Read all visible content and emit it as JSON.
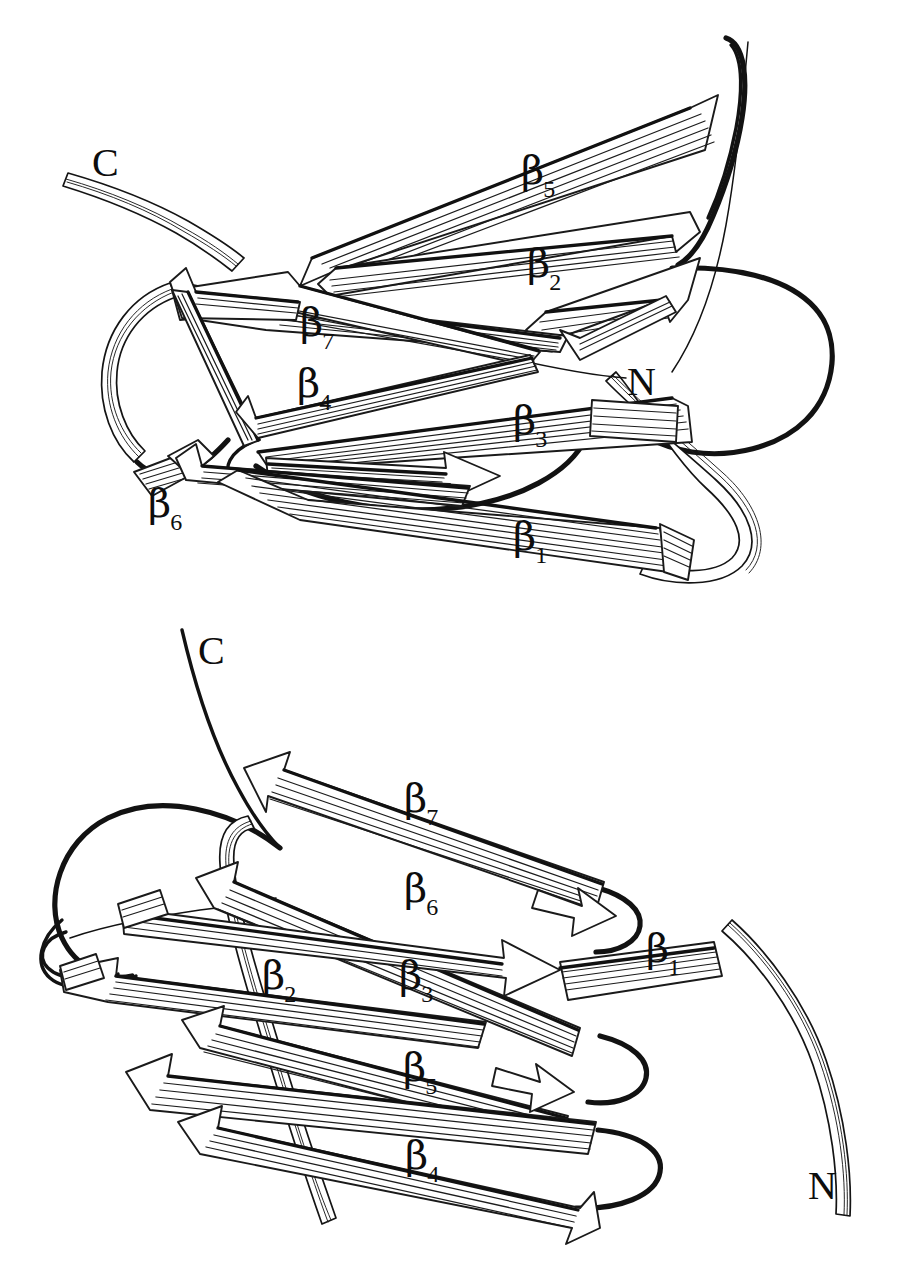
{
  "figure": {
    "kind": "protein-structure-ribbon-diagram",
    "panel_count": 2,
    "background_color": "#ffffff",
    "ink_color": "#111111"
  },
  "panels": [
    {
      "id": "top",
      "name": "top-view",
      "termini": [
        {
          "label": "C",
          "name": "c-terminus-label",
          "x": 92,
          "y": 143
        },
        {
          "label": "N",
          "name": "n-terminus-label",
          "x": 627,
          "y": 362
        }
      ],
      "strands": [
        {
          "greek": "β",
          "index": "5",
          "label": "β5",
          "x": 521,
          "y": 150
        },
        {
          "greek": "β",
          "index": "2",
          "label": "β2",
          "x": 527,
          "y": 243
        },
        {
          "greek": "β",
          "index": "7",
          "label": "β7",
          "x": 300,
          "y": 302
        },
        {
          "greek": "β",
          "index": "4",
          "label": "β4",
          "x": 297,
          "y": 363
        },
        {
          "greek": "β",
          "index": "3",
          "label": "β3",
          "x": 513,
          "y": 400
        },
        {
          "greek": "β",
          "index": "6",
          "label": "β6",
          "x": 148,
          "y": 483
        },
        {
          "greek": "β",
          "index": "1",
          "label": "β1",
          "x": 513,
          "y": 516
        }
      ]
    },
    {
      "id": "bottom",
      "name": "bottom-view",
      "termini": [
        {
          "label": "C",
          "name": "c-terminus-label",
          "x": 198,
          "y": 631
        },
        {
          "label": "N",
          "name": "n-terminus-label",
          "x": 808,
          "y": 1166
        }
      ],
      "strands": [
        {
          "greek": "β",
          "index": "7",
          "label": "β7",
          "x": 404,
          "y": 778
        },
        {
          "greek": "β",
          "index": "6",
          "label": "β6",
          "x": 404,
          "y": 868
        },
        {
          "greek": "β",
          "index": "1",
          "label": "β1",
          "x": 646,
          "y": 928
        },
        {
          "greek": "β",
          "index": "2",
          "label": "β2",
          "x": 262,
          "y": 955
        },
        {
          "greek": "β",
          "index": "3",
          "label": "β3",
          "x": 399,
          "y": 955
        },
        {
          "greek": "β",
          "index": "5",
          "label": "β5",
          "x": 403,
          "y": 1047
        },
        {
          "greek": "β",
          "index": "4",
          "label": "β4",
          "x": 405,
          "y": 1135
        }
      ]
    }
  ]
}
